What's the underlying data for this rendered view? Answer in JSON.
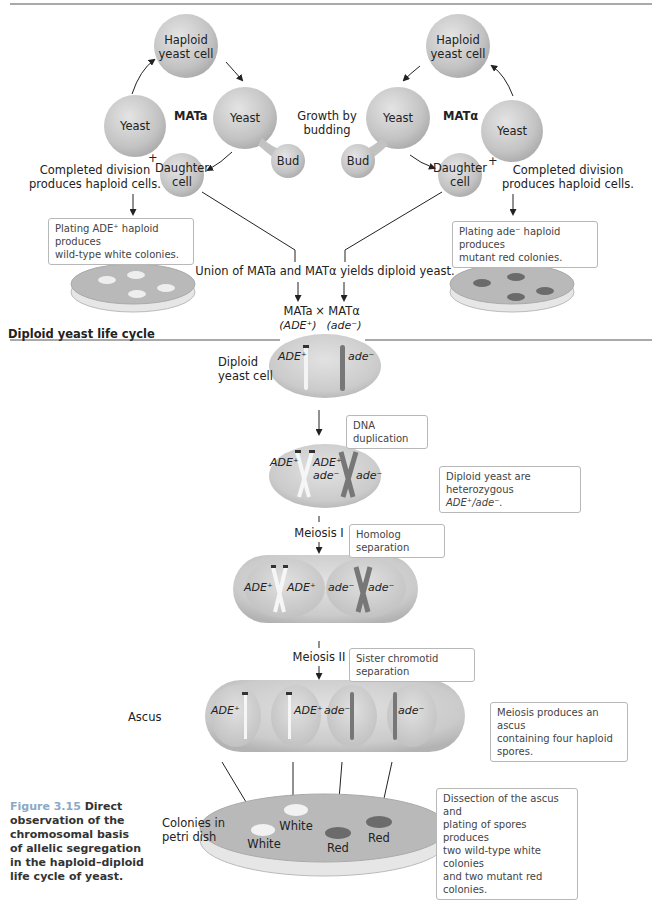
{
  "haploid_cycle": {
    "mating_types": {
      "left": "MATa",
      "right": "MATα"
    },
    "left": {
      "haploid_cell": [
        "Haploid",
        "yeast cell"
      ],
      "yeast_budding": "Yeast",
      "bud": "Bud",
      "daughter": [
        "Daughter",
        "cell"
      ],
      "yeast_mother": "Yeast",
      "division_note": [
        "Completed division",
        "produces haploid cells."
      ],
      "plating_note": [
        "Plating ADE⁺ haploid produces",
        "wild-type white colonies."
      ]
    },
    "right": {
      "haploid_cell": [
        "Haploid",
        "yeast cell"
      ],
      "yeast_budding": "Yeast",
      "bud": "Bud",
      "daughter": [
        "Daughter",
        "cell"
      ],
      "yeast_mother": "Yeast",
      "division_note": [
        "Completed division",
        "produces haploid cells."
      ],
      "plating_note": [
        "Plating ade⁻ haploid produces",
        "mutant red colonies."
      ]
    },
    "growth_label": [
      "Growth by",
      "budding"
    ],
    "plus_sign": "+",
    "union_label": "Union of MATa and MATα yields diploid yeast.",
    "cross": {
      "left": "MATa",
      "left_allele": "(ADE⁺)",
      "times": "×",
      "right": "MATα",
      "right_allele": "(ade⁻)"
    }
  },
  "diploid_cycle": {
    "section_title": "Diploid yeast life cycle",
    "diploid_cell_label": [
      "Diploid",
      "yeast cell"
    ],
    "alleles": {
      "dominant": "ADE⁺",
      "recessive": "ade⁻"
    },
    "steps": [
      {
        "label": "",
        "note": "DNA duplication"
      },
      {
        "label": "Meiosis I",
        "note": "Homolog separation"
      },
      {
        "label": "Meiosis II",
        "note": "Sister chromotid separation"
      }
    ],
    "heterozygous_note": [
      "Diploid yeast are heterozygous",
      "ADE⁺/ade⁻."
    ],
    "ascus_label": "Ascus",
    "ascus_note": [
      "Meiosis produces an ascus",
      "containing four haploid spores."
    ],
    "dish_label": [
      "Colonies in",
      "petri dish"
    ],
    "colonies": [
      "White",
      "White",
      "Red",
      "Red"
    ],
    "dissection_note": [
      "Dissection of the ascus and",
      "plating of spores produces",
      "two wild-type white colonies",
      "and two mutant red colonies."
    ]
  },
  "caption": {
    "figure_number": "Figure 3.15",
    "text": "Direct observation of the chromosomal basis of allelic segregation in the haploid–diploid life cycle of yeast."
  },
  "colors": {
    "cell_fill": "#c9c9c9",
    "dish_fill": "#b9b9b9",
    "red_colony": "#6b6b6b",
    "white_colony": "#f2f2f2",
    "caption_figure": "#8aa9c6"
  }
}
